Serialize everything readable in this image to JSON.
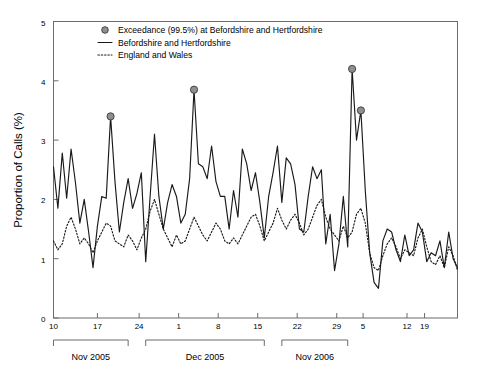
{
  "chart_data": {
    "type": "line",
    "title": "",
    "xlabel": "",
    "ylabel": "Proportion of Calls (%)",
    "ylim": [
      0,
      5
    ],
    "yticks": [
      0,
      1,
      2,
      3,
      4,
      5
    ],
    "grid": false,
    "legend_position": "top-center",
    "legend": [
      {
        "key": "exceedance",
        "label": "Exceedance (99.5%) at Befordshire and Hertfordshire",
        "marker": "filled-circle"
      },
      {
        "key": "beds_herts",
        "label": "Befordshire and Hertfordshire",
        "marker": "solid-line"
      },
      {
        "key": "england_wales",
        "label": "England and Wales",
        "marker": "dotted-line"
      }
    ],
    "x_axis_groups": [
      {
        "label": "Nov 2005",
        "ticks": [
          "10",
          "17",
          "24"
        ],
        "start_index": 0,
        "end_index": 17
      },
      {
        "label": "Dec 2005",
        "ticks": [
          "1",
          "8",
          "15",
          "22",
          "29"
        ],
        "start_index": 21,
        "end_index": 48
      },
      {
        "label": "Nov 2006",
        "ticks": [
          "5",
          "12",
          "19"
        ],
        "start_index": 52,
        "end_index": 67
      }
    ],
    "x_tick_labels": [
      "10",
      "17",
      "24",
      "1",
      "8",
      "15",
      "22",
      "29",
      "5",
      "12",
      "19"
    ],
    "x_tick_indices": [
      0,
      10,
      19.5,
      28.5,
      37.5,
      46.5,
      55.5,
      64.5,
      70.5,
      80.5,
      84.5
    ],
    "series": [
      {
        "name": "Befordshire and Hertfordshire",
        "style": "solid",
        "values": [
          2.55,
          1.85,
          2.78,
          2.02,
          2.85,
          2.28,
          1.6,
          2.0,
          1.45,
          0.85,
          1.55,
          2.05,
          2.02,
          3.4,
          2.3,
          1.45,
          1.95,
          2.35,
          1.85,
          2.1,
          2.45,
          0.95,
          2.05,
          3.1,
          2.05,
          1.5,
          1.95,
          2.25,
          2.05,
          1.6,
          1.75,
          2.35,
          3.85,
          2.6,
          2.55,
          2.35,
          2.9,
          2.3,
          2.05,
          2.05,
          1.5,
          2.15,
          1.7,
          2.85,
          2.6,
          2.15,
          2.45,
          1.95,
          1.35,
          2.05,
          2.45,
          2.9,
          1.95,
          2.7,
          2.6,
          2.25,
          1.5,
          1.45,
          2.05,
          2.55,
          2.35,
          2.5,
          1.25,
          1.75,
          0.8,
          1.25,
          2.05,
          1.2,
          4.2,
          3.0,
          3.5,
          2.15,
          1.1,
          0.6,
          0.5,
          1.3,
          1.5,
          1.45,
          1.15,
          0.95,
          1.4,
          1.05,
          1.15,
          1.6,
          1.45,
          0.95,
          1.1,
          1.05,
          1.3,
          0.85,
          1.45,
          1.0,
          0.85
        ]
      },
      {
        "name": "England and Wales",
        "style": "dotted",
        "values": [
          1.3,
          1.15,
          1.25,
          1.55,
          1.7,
          1.5,
          1.25,
          1.35,
          1.25,
          1.1,
          1.3,
          1.45,
          1.6,
          1.55,
          1.3,
          1.25,
          1.2,
          1.4,
          1.3,
          1.15,
          1.35,
          1.5,
          1.8,
          2.0,
          1.75,
          1.5,
          1.35,
          1.2,
          1.4,
          1.25,
          1.3,
          1.5,
          1.7,
          1.55,
          1.4,
          1.3,
          1.45,
          1.6,
          1.5,
          1.3,
          1.25,
          1.35,
          1.25,
          1.4,
          1.55,
          1.7,
          1.75,
          1.55,
          1.3,
          1.45,
          1.6,
          1.85,
          1.65,
          1.5,
          1.65,
          1.75,
          1.6,
          1.4,
          1.5,
          1.7,
          1.9,
          2.0,
          1.7,
          1.5,
          1.4,
          1.3,
          1.55,
          1.35,
          1.45,
          1.75,
          1.85,
          1.6,
          1.1,
          0.85,
          0.8,
          1.05,
          1.25,
          1.35,
          1.2,
          1.0,
          1.15,
          1.1,
          1.05,
          1.35,
          1.5,
          1.2,
          0.95,
          0.9,
          1.05,
          0.85,
          1.2,
          1.05,
          0.8
        ]
      }
    ],
    "exceedance_points": [
      {
        "index": 13,
        "value": 3.4
      },
      {
        "index": 32,
        "value": 3.85
      },
      {
        "index": 68,
        "value": 4.2
      },
      {
        "index": 70,
        "value": 3.5
      }
    ]
  }
}
